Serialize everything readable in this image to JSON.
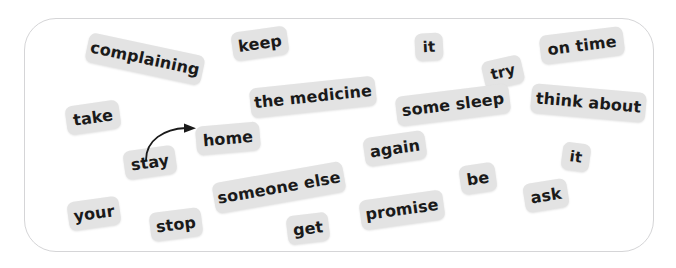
{
  "canvas": {
    "width": 676,
    "height": 268,
    "background_color": "#ffffff"
  },
  "word_bank": {
    "frame": {
      "border_color": "#d5d5d7",
      "corner_radius": 32
    },
    "chip_style": {
      "background_color": "#e3e3e3",
      "text_color": "#1a1a1a"
    },
    "chips": [
      {
        "label": "complaining",
        "x": 86,
        "y": 44,
        "w": 118,
        "h": 30,
        "rotate": 12,
        "font": 16
      },
      {
        "label": "keep",
        "x": 232,
        "y": 29,
        "w": 56,
        "h": 29,
        "rotate": -8,
        "font": 16
      },
      {
        "label": "it",
        "x": 415,
        "y": 33,
        "w": 28,
        "h": 28,
        "rotate": -3,
        "font": 15
      },
      {
        "label": "on time",
        "x": 540,
        "y": 31,
        "w": 84,
        "h": 29,
        "rotate": -7,
        "font": 16
      },
      {
        "label": "try",
        "x": 483,
        "y": 58,
        "w": 40,
        "h": 29,
        "rotate": -13,
        "font": 15
      },
      {
        "label": "the medicine",
        "x": 250,
        "y": 82,
        "w": 126,
        "h": 30,
        "rotate": -6,
        "font": 16
      },
      {
        "label": "some sleep",
        "x": 396,
        "y": 90,
        "w": 114,
        "h": 30,
        "rotate": -7,
        "font": 16
      },
      {
        "label": "think about",
        "x": 531,
        "y": 88,
        "w": 115,
        "h": 30,
        "rotate": 5,
        "font": 16
      },
      {
        "label": "take",
        "x": 66,
        "y": 103,
        "w": 54,
        "h": 29,
        "rotate": -8,
        "font": 16
      },
      {
        "label": "home",
        "x": 196,
        "y": 124,
        "w": 64,
        "h": 29,
        "rotate": -5,
        "font": 16
      },
      {
        "label": "again",
        "x": 364,
        "y": 134,
        "w": 62,
        "h": 29,
        "rotate": -8,
        "font": 16
      },
      {
        "label": "it",
        "x": 562,
        "y": 143,
        "w": 28,
        "h": 28,
        "rotate": 8,
        "font": 15
      },
      {
        "label": "stay",
        "x": 124,
        "y": 148,
        "w": 52,
        "h": 29,
        "rotate": -8,
        "font": 16
      },
      {
        "label": "someone else",
        "x": 213,
        "y": 172,
        "w": 132,
        "h": 31,
        "rotate": -10,
        "font": 16
      },
      {
        "label": "be",
        "x": 460,
        "y": 164,
        "w": 36,
        "h": 29,
        "rotate": -8,
        "font": 16
      },
      {
        "label": "ask",
        "x": 524,
        "y": 181,
        "w": 44,
        "h": 29,
        "rotate": -9,
        "font": 16
      },
      {
        "label": "your",
        "x": 68,
        "y": 199,
        "w": 52,
        "h": 29,
        "rotate": -8,
        "font": 16
      },
      {
        "label": "promise",
        "x": 360,
        "y": 195,
        "w": 84,
        "h": 30,
        "rotate": -8,
        "font": 16
      },
      {
        "label": "stop",
        "x": 150,
        "y": 210,
        "w": 52,
        "h": 29,
        "rotate": -7,
        "font": 16
      },
      {
        "label": "get",
        "x": 287,
        "y": 214,
        "w": 42,
        "h": 29,
        "rotate": -7,
        "font": 16
      }
    ],
    "annotation": {
      "type": "curved-arrow",
      "from_chip": "stay",
      "to_chip": "home",
      "color": "#1a1a1a"
    }
  }
}
